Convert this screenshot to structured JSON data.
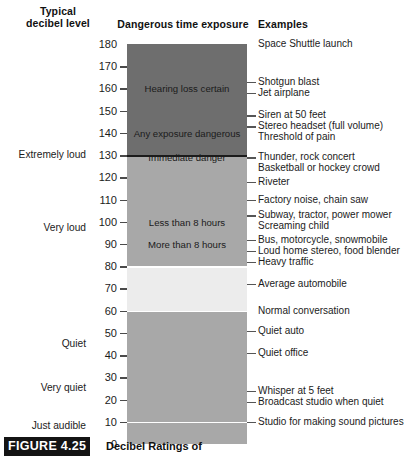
{
  "headers": {
    "typical": "Typical\ndecibel level",
    "typical_line1": "Typical",
    "typical_line2": "decibel level",
    "danger": "Dangerous time exposure",
    "examples": "Examples"
  },
  "caption": {
    "figure_tag": "FIGURE 4.25",
    "text": "Decibel Ratings of"
  },
  "colors": {
    "band_extreme": "#6e6e6e",
    "band_veryloud": "#a8a8a8",
    "band_moderate": "#ececec",
    "band_quiet": "#a8a8a8",
    "separator": "#ffffff",
    "separator_dark": "#1b1b1b",
    "tick": "#4a4a4a",
    "text": "#1b1b1b"
  },
  "chart_data": {
    "type": "bar",
    "title": "Decibel Ratings of",
    "ylabel": "Typical decibel level",
    "xlabel": "",
    "ylim": [
      0,
      180
    ],
    "grid": false,
    "legend_position": "none",
    "axis_ticks": [
      180,
      170,
      160,
      150,
      140,
      130,
      120,
      110,
      100,
      90,
      80,
      70,
      60,
      50,
      40,
      30,
      20,
      10,
      0
    ],
    "bands": [
      {
        "label": "Hearing loss certain",
        "from_db": 140,
        "to_db": 180,
        "color": "#6e6e6e",
        "label_db": 160
      },
      {
        "label": "Any exposure dangerous",
        "from_db": 130,
        "to_db": 140,
        "color": "#6e6e6e",
        "label_db": 140
      },
      {
        "label": "Immediate danger",
        "from_db": 125,
        "to_db": 130,
        "color": "#a8a8a8",
        "label_db": 129
      },
      {
        "label": "Less than 8 hours",
        "from_db": 90,
        "to_db": 125,
        "color": "#a8a8a8",
        "label_db": 100
      },
      {
        "label": "More than 8 hours",
        "from_db": 80,
        "to_db": 90,
        "color": "#a8a8a8",
        "label_db": 90
      },
      {
        "label": "",
        "from_db": 60,
        "to_db": 80,
        "color": "#ececec",
        "label_db": 70
      },
      {
        "label": "",
        "from_db": 0,
        "to_db": 60,
        "color": "#a8a8a8",
        "label_db": 30
      }
    ],
    "separators_db": [
      130,
      80,
      60,
      10
    ],
    "loudness_labels": [
      {
        "text": "Extremely loud",
        "db": 130
      },
      {
        "text": "Very loud",
        "db": 97
      },
      {
        "text": "Quiet",
        "db": 45
      },
      {
        "text": "Very quiet",
        "db": 25
      },
      {
        "text": "Just audible",
        "db": 8
      }
    ],
    "examples": [
      {
        "text": "Space Shuttle launch",
        "db": 180,
        "tick": false
      },
      {
        "text": "Shotgun blast",
        "db": 163,
        "tick": true
      },
      {
        "text": "Jet airplane",
        "db": 158,
        "tick": true
      },
      {
        "text": "Siren at 50 feet",
        "db": 148,
        "tick": true
      },
      {
        "text": "Stereo headset (full volume)",
        "db": 143,
        "tick": true
      },
      {
        "text": "Threshold of pain",
        "db": 138,
        "tick": false
      },
      {
        "text": "Thunder, rock concert",
        "db": 129,
        "tick": true
      },
      {
        "text": "Basketball or hockey crowd",
        "db": 124,
        "tick": false
      },
      {
        "text": "Riveter",
        "db": 118,
        "tick": true
      },
      {
        "text": "Factory noise, chain saw",
        "db": 110,
        "tick": true
      },
      {
        "text": "Subway, tractor, power mower",
        "db": 103,
        "tick": true
      },
      {
        "text": "Screaming child",
        "db": 98,
        "tick": false
      },
      {
        "text": "Bus, motorcycle, snowmobile",
        "db": 92,
        "tick": true
      },
      {
        "text": "Loud home stereo, food blender",
        "db": 87,
        "tick": true
      },
      {
        "text": "Heavy traffic",
        "db": 82,
        "tick": true
      },
      {
        "text": "Average automobile",
        "db": 72,
        "tick": true
      },
      {
        "text": "Normal conversation",
        "db": 60,
        "tick": false
      },
      {
        "text": "Quiet auto",
        "db": 51,
        "tick": true
      },
      {
        "text": "Quiet office",
        "db": 41,
        "tick": true
      },
      {
        "text": "Whisper at 5 feet",
        "db": 24,
        "tick": true
      },
      {
        "text": "Broadcast studio when quiet",
        "db": 19,
        "tick": true
      },
      {
        "text": "Studio for making sound pictures",
        "db": 10,
        "tick": true
      }
    ]
  }
}
